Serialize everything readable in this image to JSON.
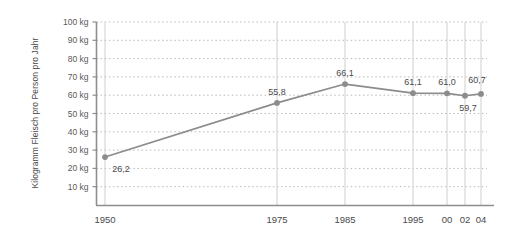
{
  "chart_data": {
    "type": "line",
    "title": "",
    "subtitle": "",
    "xlabel": "",
    "ylabel": "Kilogramm Fleisch pro Person pro Jahr",
    "categories": [
      "1950",
      "1975",
      "1985",
      "1995",
      "00",
      "02",
      "04"
    ],
    "x_tick_labels": [
      "1950",
      "1975",
      "1985",
      "1995",
      "00",
      "02",
      "04"
    ],
    "values": [
      26.2,
      55.8,
      66.1,
      61.1,
      61.0,
      59.7,
      60.7
    ],
    "value_labels": [
      "26,2",
      "55,8",
      "66,1",
      "61,1",
      "61,0",
      "59,7",
      "60,7"
    ],
    "value_label_positions": [
      "below",
      "above",
      "above",
      "above",
      "above",
      "below",
      "above"
    ],
    "y_tick_labels": [
      "10 kg",
      "20 kg",
      "30 kg",
      "40 kg",
      "50 kg",
      "60 kg",
      "70 kg",
      "80 kg",
      "90 kg",
      "100 kg"
    ],
    "y_tick_values": [
      10,
      20,
      30,
      40,
      50,
      60,
      70,
      80,
      90,
      100
    ],
    "ylim": [
      0,
      100
    ],
    "grid": "dotted-horizontal-and-vertical",
    "legend": "none",
    "series": [
      {
        "name": "Fleischverbrauch",
        "values": [
          26.2,
          55.8,
          66.1,
          61.1,
          61.0,
          59.7,
          60.7
        ]
      }
    ],
    "colors": {
      "line": "#8c8c8c",
      "marker": "#8c8c8c",
      "grid": "#b9b9b9",
      "axis": "#8e8e8e",
      "text": "#4a4a4a",
      "background": "#ffffff"
    }
  }
}
